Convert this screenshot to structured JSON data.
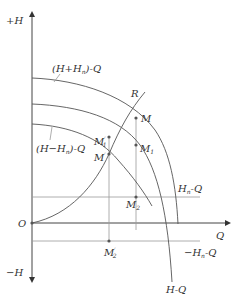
{
  "diagram": {
    "axes": {
      "y_pos_label": "+H",
      "y_neg_label": "−H",
      "x_label": "Q",
      "origin_label": "O"
    },
    "curves": [
      {
        "id": "h-plus-hn",
        "label": "(H+H",
        "sub": "n",
        "suffix": ")-Q"
      },
      {
        "id": "h",
        "label": "H-Q"
      },
      {
        "id": "h-minus-hn",
        "label": "(H−H",
        "sub": "n",
        "suffix": ")-Q"
      },
      {
        "id": "r",
        "label": "R"
      },
      {
        "id": "hn",
        "label": "H",
        "sub": "n",
        "suffix": "-Q"
      },
      {
        "id": "neg-hn",
        "label": "−H",
        "sub": "n",
        "suffix": "-Q"
      }
    ],
    "points": [
      {
        "id": "M",
        "label": "M",
        "sub": "",
        "prime": ""
      },
      {
        "id": "M1",
        "label": "M",
        "sub": "1",
        "prime": ""
      },
      {
        "id": "M2",
        "label": "M",
        "sub": "2",
        "prime": ""
      },
      {
        "id": "M-prime",
        "label": "M",
        "sub": "",
        "prime": "′"
      },
      {
        "id": "M1-prime",
        "label": "M",
        "sub": "1",
        "prime": "′"
      },
      {
        "id": "M2-prime",
        "label": "M",
        "sub": "2",
        "prime": "′"
      }
    ],
    "colors": {
      "curve": "#555555",
      "axis": "#444444",
      "guide": "#999999",
      "text": "#333333",
      "background": "#ffffff"
    }
  }
}
